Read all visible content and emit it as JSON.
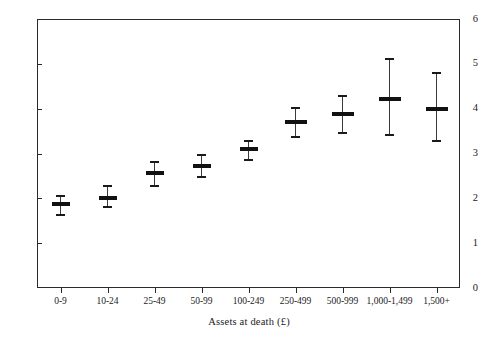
{
  "chart_data": {
    "type": "scatter",
    "title": "",
    "xlabel": "Assets at death (£)",
    "ylabel": "Children per testator",
    "categories": [
      "0-9",
      "10-24",
      "25-49",
      "50-99",
      "100-249",
      "250-499",
      "500-999",
      "1,000-1,499",
      "1,500+"
    ],
    "values": [
      1.87,
      2.0,
      2.56,
      2.73,
      3.09,
      3.71,
      3.89,
      4.22,
      4.0
    ],
    "error_low": [
      1.64,
      1.82,
      2.29,
      2.49,
      2.87,
      3.4,
      3.48,
      3.44,
      3.29
    ],
    "error_high": [
      2.08,
      2.29,
      2.84,
      2.98,
      3.31,
      4.04,
      4.31,
      5.13,
      4.82
    ],
    "ylim": [
      0,
      6
    ],
    "yticks": [
      0,
      1,
      2,
      3,
      4,
      5,
      6
    ],
    "ytick_labels": [
      "0",
      "1",
      "2",
      "3",
      "4",
      "5",
      "6"
    ],
    "grid": false,
    "legend": null,
    "marker_style": "point-estimate-with-95pct-confidence-interval",
    "series_color": "#111111"
  },
  "axes": {
    "y_title": "Children per testator",
    "x_title": "Assets at death (£)"
  }
}
